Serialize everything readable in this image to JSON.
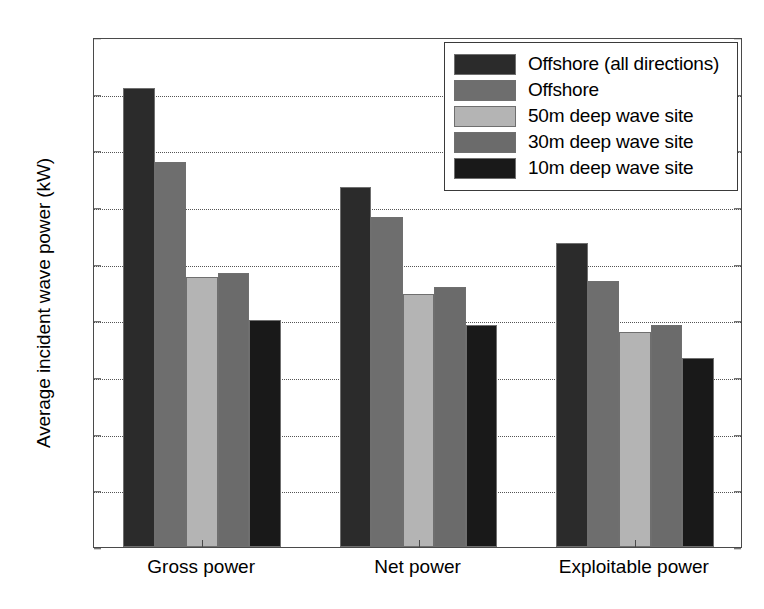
{
  "chart_data": {
    "type": "bar",
    "title": "",
    "xlabel": "",
    "ylabel": "Average incident wave power (kW)",
    "ylim": [
      0,
      45
    ],
    "ytick_step": 5,
    "yticks": [
      0,
      5,
      10,
      15,
      20,
      25,
      30,
      35,
      40,
      45
    ],
    "grid": "horizontal-dotted",
    "legend_position": "top-right",
    "categories": [
      "Gross power",
      "Net power",
      "Exploitable power"
    ],
    "series": [
      {
        "name": "Offshore (all directions)",
        "color": "#2b2b2b",
        "values": [
          40.5,
          31.8,
          26.8
        ]
      },
      {
        "name": "Offshore",
        "color": "#6e6e6e",
        "values": [
          34.0,
          29.1,
          23.5
        ]
      },
      {
        "name": "50m deep wave site",
        "color": "#b4b4b4",
        "values": [
          23.8,
          22.3,
          19.0
        ]
      },
      {
        "name": "30m deep wave site",
        "color": "#6b6b6b",
        "values": [
          24.2,
          22.9,
          19.6
        ]
      },
      {
        "name": "10m deep wave site",
        "color": "#191919",
        "values": [
          20.0,
          19.6,
          16.7
        ]
      }
    ]
  },
  "axis": {
    "frame_color": "#4a4a4a",
    "gridline_color": "#555555"
  }
}
